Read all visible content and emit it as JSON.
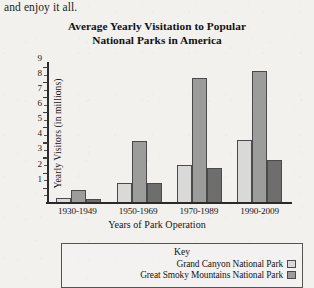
{
  "page": {
    "body_text": "and enjoy it all."
  },
  "chart_data": {
    "type": "bar",
    "title": "Average Yearly Visitation to Popular National Parks in America",
    "title_line1": "Average Yearly Visitation to Popular",
    "title_line2": "National Parks in America",
    "xlabel": "Years of Park Operation",
    "ylabel": "Yearly Visitors (in millions)",
    "categories": [
      "1930-1949",
      "1950-1969",
      "1970-1989",
      "1990-2009"
    ],
    "ylim": [
      0,
      9.4
    ],
    "yticks": [
      1,
      2,
      3,
      4,
      5,
      6,
      7,
      8,
      9
    ],
    "ytick_labels": [
      "1",
      "2",
      "3",
      "4",
      "5",
      "6",
      "7",
      "8",
      "9"
    ],
    "grid": false,
    "legend_position": "below-plot",
    "legend_title": "Key",
    "series": [
      {
        "name": "Grand Canyon National Park",
        "color": "#d9d9d7",
        "values": [
          0.3,
          1.3,
          2.5,
          4.2
        ]
      },
      {
        "name": "Great Smoky Mountains National Park",
        "color": "#9c9c9a",
        "values": [
          0.8,
          4.1,
          8.3,
          8.8
        ]
      },
      {
        "name": "",
        "color": "#6e6e6c",
        "values": [
          0.2,
          1.3,
          2.3,
          2.8
        ]
      }
    ]
  }
}
